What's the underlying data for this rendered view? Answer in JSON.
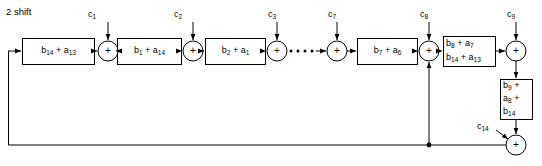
{
  "diagram": {
    "title": "2 shift",
    "type": "block-diagram",
    "adder_symbol": "+",
    "blocks": [
      {
        "id": "blk-b14-a13",
        "lines": [
          "b₁₄ + a₁₃"
        ],
        "x": 22,
        "y": 38,
        "w": 72,
        "h": 26
      },
      {
        "id": "blk-b1-a14",
        "lines": [
          "b₁ + a₁₄"
        ],
        "x": 117,
        "y": 38,
        "w": 64,
        "h": 26
      },
      {
        "id": "blk-b2-a1",
        "lines": [
          "b₂ + a₁"
        ],
        "x": 205,
        "y": 38,
        "w": 60,
        "h": 26
      },
      {
        "id": "blk-b7-a6",
        "lines": [
          "b₇ + a₆"
        ],
        "x": 357,
        "y": 38,
        "w": 60,
        "h": 26
      },
      {
        "id": "blk-b8-a7",
        "lines": [
          "b₈ + a₇",
          "b₁₄ + a₁₃"
        ],
        "x": 443,
        "y": 36,
        "w": 52,
        "h": 30
      },
      {
        "id": "blk-b9-a8-b14",
        "lines": [
          "b₉ +",
          "a₈ +",
          "b₁₄"
        ],
        "x": 500,
        "y": 79,
        "w": 32,
        "h": 40
      }
    ],
    "adders": [
      {
        "id": "adder-c1",
        "cx": 108,
        "cy": 51,
        "r": 10
      },
      {
        "id": "adder-c2",
        "cx": 193,
        "cy": 51,
        "r": 10
      },
      {
        "id": "adder-c3",
        "cx": 277,
        "cy": 51,
        "r": 10
      },
      {
        "id": "adder-c7",
        "cx": 337,
        "cy": 51,
        "r": 10
      },
      {
        "id": "adder-c8",
        "cx": 429,
        "cy": 51,
        "r": 10
      },
      {
        "id": "adder-c9",
        "cx": 516,
        "cy": 51,
        "r": 10
      },
      {
        "id": "adder-c14",
        "cx": 516,
        "cy": 145,
        "r": 10
      }
    ],
    "coefficients": [
      {
        "id": "c1",
        "text": "c₁",
        "x": 88,
        "y": 10
      },
      {
        "id": "c2",
        "text": "c₂",
        "x": 174,
        "y": 10
      },
      {
        "id": "c3",
        "text": "c₃",
        "x": 268,
        "y": 10
      },
      {
        "id": "c7",
        "text": "c₇",
        "x": 328,
        "y": 10
      },
      {
        "id": "c8",
        "text": "c₈",
        "x": 420,
        "y": 10
      },
      {
        "id": "c9",
        "text": "c₉",
        "x": 507,
        "y": 10
      },
      {
        "id": "c14",
        "text": "c₁₄",
        "x": 480,
        "y": 124
      }
    ],
    "ellipsis_dots": 4,
    "colors": {
      "stroke": "#000000",
      "fill": "#ffffff",
      "background": "#ffffff"
    }
  }
}
